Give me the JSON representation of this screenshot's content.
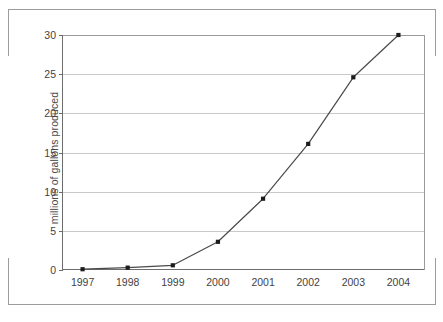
{
  "chart_data": {
    "type": "line",
    "title": "",
    "xlabel": "",
    "ylabel": "millions of gallons produced",
    "categories": [
      "1997",
      "1998",
      "1999",
      "2000",
      "2001",
      "2002",
      "2003",
      "2004"
    ],
    "x": [
      1997,
      1998,
      1999,
      2000,
      2001,
      2002,
      2003,
      2004
    ],
    "values": [
      0.1,
      0.3,
      0.6,
      3.6,
      9.1,
      16.1,
      24.6,
      30.0
    ],
    "series": [
      {
        "name": "millions of gallons produced",
        "values": [
          0.1,
          0.3,
          0.6,
          3.6,
          9.1,
          16.1,
          24.6,
          30.0
        ]
      }
    ],
    "ylim": [
      0,
      30
    ],
    "y_ticks": [
      0,
      5,
      10,
      15,
      20,
      25,
      30
    ],
    "y_tick_labels": [
      "0",
      "5",
      "10",
      "15",
      "20",
      "25",
      "30"
    ],
    "x_tick_labels": [
      "1997",
      "1998",
      "1999",
      "2000",
      "2001",
      "2002",
      "2003",
      "2004"
    ],
    "grid": true,
    "grid_axis": "y",
    "legend": false,
    "legend_position": "none",
    "marker": "square",
    "line_color": "#4a4a4a",
    "marker_color": "#1c1c1c",
    "grid_color": "#c9c9c9",
    "axis_color": "#6d6d6d",
    "background_color": "#ffffff"
  },
  "frame": {
    "border_color": "#9c9c9c"
  }
}
